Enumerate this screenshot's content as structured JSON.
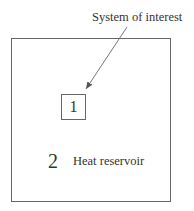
{
  "diagram": {
    "callout_label": "System of interest",
    "system": {
      "label": "1"
    },
    "reservoir": {
      "number": "2",
      "label": "Heat reservoir"
    },
    "colors": {
      "line": "#666666",
      "text": "#333333",
      "background": "#ffffff"
    }
  }
}
